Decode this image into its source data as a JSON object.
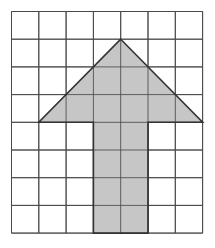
{
  "figure": {
    "grid": {
      "columns": 7,
      "rows": 8,
      "origin_x": 11.5,
      "origin_y": 11.5,
      "cell_w": 27.3,
      "cell_h": 27.7,
      "line_color": "#4a4a4a"
    },
    "arrow": {
      "fill_color": "#c6c6c6",
      "stroke_color": "#333333",
      "vertices_grid": [
        [
          4,
          1
        ],
        [
          7,
          4
        ],
        [
          5,
          4
        ],
        [
          5,
          8
        ],
        [
          3,
          8
        ],
        [
          3,
          4
        ],
        [
          1,
          4
        ]
      ]
    }
  }
}
